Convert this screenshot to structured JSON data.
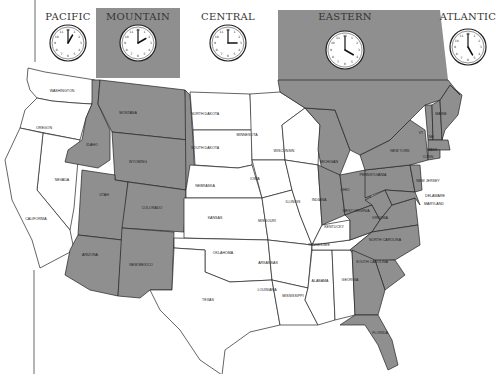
{
  "map": {
    "title": "US Time Zones",
    "colors": {
      "zone_shade": "#8f8f8f",
      "land": "#ffffff",
      "border": "#222222"
    }
  },
  "zones": [
    {
      "name": "PACIFIC",
      "clock_time": "1:00",
      "hour": 1,
      "minute": 0,
      "shaded": false
    },
    {
      "name": "MOUNTAIN",
      "clock_time": "2:00",
      "hour": 2,
      "minute": 0,
      "shaded": true
    },
    {
      "name": "CENTRAL",
      "clock_time": "3:00",
      "hour": 3,
      "minute": 0,
      "shaded": false
    },
    {
      "name": "EASTERN",
      "clock_time": "4:00",
      "hour": 4,
      "minute": 0,
      "shaded": true
    },
    {
      "name": "ATLANTIC",
      "clock_time": "5:00",
      "hour": 5,
      "minute": 0,
      "shaded": false
    }
  ],
  "states": {
    "washington": "WASHINGTON",
    "oregon": "OREGON",
    "california": "CALIFORNIA",
    "nevada": "NEVADA",
    "idaho": "IDAHO",
    "montana": "MONTANA",
    "wyoming": "WYOMING",
    "utah": "UTAH",
    "colorado": "COLORADO",
    "arizona": "ARIZONA",
    "new_mexico": "NEW MEXICO",
    "north_dakota": "NORTH DAKOTA",
    "south_dakota": "SOUTH DAKOTA",
    "nebraska": "NEBRASKA",
    "kansas": "KANSAS",
    "oklahoma": "OKLAHOMA",
    "texas": "TEXAS",
    "minnesota": "MINNESOTA",
    "iowa": "IOWA",
    "missouri": "MISSOURI",
    "arkansas": "ARKANSAS",
    "louisiana": "LOUISIANA",
    "wisconsin": "WISCONSIN",
    "illinois": "ILLINOIS",
    "mississippi": "MISSISSIPPI",
    "alabama": "ALABAMA",
    "tennessee": "TENNESSEE",
    "kentucky": "KENTUCKY",
    "michigan": "MICHIGAN",
    "indiana": "INDIANA",
    "ohio": "OHIO",
    "georgia": "GEORGIA",
    "florida": "FLORIDA",
    "south_carolina": "SOUTH CAROLINA",
    "north_carolina": "NORTH CAROLINA",
    "virginia": "VIRGINIA",
    "west_virginia": "WEST VIRGINIA",
    "pennsylvania": "PENNSYLVANIA",
    "new_york": "NEW YORK",
    "new_jersey": "NEW JERSEY",
    "delaware": "DELAWARE",
    "maryland": "MARYLAND",
    "maine": "MAINE",
    "vermont": "VT",
    "new_hampshire": "NH",
    "massachusetts": "MASS",
    "connecticut": "CONN"
  }
}
